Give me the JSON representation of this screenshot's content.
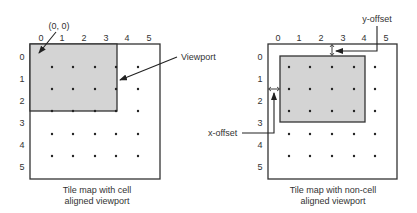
{
  "left": {
    "col_labels": [
      "0",
      "1",
      "2",
      "3",
      "4",
      "5"
    ],
    "row_labels": [
      "0",
      "1",
      "2",
      "3",
      "4",
      "5"
    ],
    "origin_label": "(0, 0)",
    "viewport_label": "Viewport",
    "caption_line1": "Tile map with cell",
    "caption_line2": "aligned viewport"
  },
  "right": {
    "col_labels": [
      "0",
      "1",
      "2",
      "3",
      "4",
      "5"
    ],
    "row_labels": [
      "0",
      "1",
      "2",
      "3",
      "4",
      "5"
    ],
    "y_offset_label": "y-offset",
    "x_offset_label": "x-offset",
    "caption_line1": "Tile map with non-cell",
    "caption_line2": "aligned viewport"
  },
  "colors": {
    "viewport_fill": "#d4d4d4",
    "stroke": "#333333"
  }
}
